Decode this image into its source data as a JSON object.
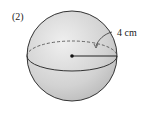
{
  "problem_number": "(2)",
  "figure": {
    "shape": "sphere",
    "radius_label": "4 cm",
    "fill_color": "#d4d4d4",
    "stroke_color": "#333333"
  }
}
